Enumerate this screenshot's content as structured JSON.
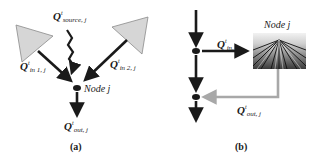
{
  "panels": [
    {
      "id": "a",
      "caption": "(a)",
      "node_label": "Node j",
      "labels": {
        "source": {
          "q": "Q",
          "sup": "t",
          "sub": "source, j"
        },
        "in1": {
          "q": "Q",
          "sup": "t",
          "sub": "in  1, j"
        },
        "in2": {
          "q": "Q",
          "sup": "t",
          "sub": "in  2, j"
        },
        "out": {
          "q": "Q",
          "sup": "t",
          "sub": "out, j"
        }
      },
      "elements": [
        "triangle-upstream-1",
        "triangle-upstream-2",
        "wavy-source-arrow",
        "inflow-arrow-1",
        "inflow-arrow-2",
        "node-dot",
        "outflow-arrow"
      ]
    },
    {
      "id": "b",
      "caption": "(b)",
      "node_label": "Node j",
      "labels": {
        "in": {
          "q": "Q",
          "sup": "t",
          "sub": "in, j"
        },
        "out": {
          "q": "Q",
          "sup": "t",
          "sub": "out, j"
        }
      },
      "elements": [
        "main-channel",
        "diversion-node-dot",
        "return-node-dot",
        "field-image",
        "diversion-arrow",
        "return-flow-arrow"
      ]
    }
  ],
  "colors": {
    "arrow": "#1a1a1a",
    "triangle_fill": "#d6d6d6",
    "triangle_stroke": "#8a8a8a",
    "return_flow": "#a8a8a8"
  }
}
